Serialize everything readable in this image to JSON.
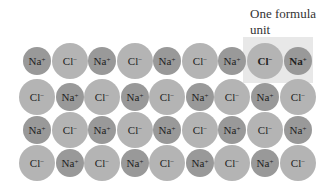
{
  "label": {
    "line1": "One formula",
    "line2": "unit"
  },
  "ions": {
    "na": {
      "symbol": "Na",
      "charge": "+"
    },
    "cl": {
      "symbol": "Cl",
      "charge": "−"
    }
  },
  "grid": {
    "rows": [
      [
        "na",
        "cl",
        "na",
        "cl",
        "na",
        "cl",
        "na",
        "cl",
        "na"
      ],
      [
        "cl",
        "na",
        "cl",
        "na",
        "cl",
        "na",
        "cl",
        "na",
        "cl"
      ],
      [
        "na",
        "cl",
        "na",
        "cl",
        "na",
        "cl",
        "na",
        "cl",
        "na"
      ],
      [
        "cl",
        "na",
        "cl",
        "na",
        "cl",
        "na",
        "cl",
        "na",
        "cl"
      ]
    ],
    "highlight": {
      "row": 0,
      "cols": [
        7,
        8
      ]
    }
  },
  "colors": {
    "cl": "#b4b4b4",
    "na": "#999999",
    "highlight": "#e8e8e8"
  }
}
